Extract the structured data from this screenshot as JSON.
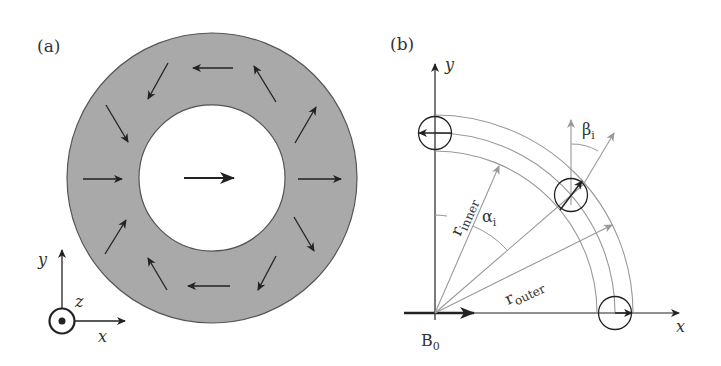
{
  "panels": {
    "a": {
      "label": "(a)",
      "ring": {
        "cx": 212,
        "cy": 178,
        "outer_r": 145,
        "inner_r": 73,
        "fill": "#a9a9a9",
        "stroke": "#555555"
      },
      "center_arrow": {
        "x1": 184,
        "y1": 178,
        "x2": 234,
        "y2": 178
      },
      "ring_arrows": [
        {
          "x1": 233,
          "y1": 68,
          "x2": 193,
          "y2": 68
        },
        {
          "x1": 168,
          "y1": 63,
          "x2": 148,
          "y2": 99
        },
        {
          "x1": 106,
          "y1": 105,
          "x2": 128,
          "y2": 142
        },
        {
          "x1": 83,
          "y1": 179,
          "x2": 122,
          "y2": 179
        },
        {
          "x1": 105,
          "y1": 254,
          "x2": 126,
          "y2": 220
        },
        {
          "x1": 167,
          "y1": 290,
          "x2": 148,
          "y2": 258
        },
        {
          "x1": 230,
          "y1": 286,
          "x2": 188,
          "y2": 286
        },
        {
          "x1": 276,
          "y1": 256,
          "x2": 258,
          "y2": 290
        },
        {
          "x1": 294,
          "y1": 217,
          "x2": 314,
          "y2": 251
        },
        {
          "x1": 298,
          "y1": 179,
          "x2": 341,
          "y2": 179
        },
        {
          "x1": 295,
          "y1": 143,
          "x2": 316,
          "y2": 107
        },
        {
          "x1": 276,
          "y1": 102,
          "x2": 254,
          "y2": 66
        }
      ],
      "axes": {
        "y_label": "y",
        "z_label": "z",
        "x_label": "x",
        "z_symbol": "out-of-page (dot in circle)"
      }
    },
    "b": {
      "label": "(b)",
      "origin": {
        "x": 435,
        "y": 313
      },
      "x_axis_label": "x",
      "y_axis_label": "y",
      "field_label": "B",
      "field_subscript": "0",
      "arc_radii": {
        "inner": 162,
        "middle": 180,
        "outer": 198
      },
      "r_inner_label": "r",
      "r_inner_subscript": "inner",
      "r_outer_label": "r",
      "r_outer_subscript": "outer",
      "alpha_label": "α",
      "alpha_subscript": "i",
      "beta_label": "β",
      "beta_subscript": "i",
      "magnets": [
        {
          "position": "top (on y-axis)",
          "angle_from_y_deg": 0,
          "direction": "left"
        },
        {
          "position": "middle (alpha_i)",
          "angle_from_y_deg": 49,
          "direction": "tilted by beta_i"
        },
        {
          "position": "bottom (on x-axis)",
          "angle_from_y_deg": 90,
          "direction": "right"
        }
      ],
      "colors": {
        "dark": "#222222",
        "gray": "#999999"
      }
    }
  }
}
